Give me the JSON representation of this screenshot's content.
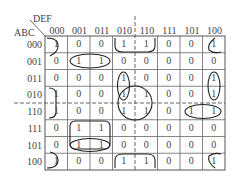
{
  "kmap": {
    "row_variables": "ABC",
    "col_variables": "DEF",
    "col_labels": [
      "000",
      "001",
      "011",
      "010",
      "110",
      "111",
      "101",
      "100"
    ],
    "row_labels": [
      "000",
      "001",
      "011",
      "010",
      "110",
      "111",
      "101",
      "100"
    ],
    "values": [
      [
        "1",
        "0",
        "0",
        "1",
        "1",
        "0",
        "0",
        "1"
      ],
      [
        "0",
        "1",
        "1",
        "0",
        "0",
        "0",
        "0",
        "0"
      ],
      [
        "0",
        "0",
        "0",
        "1",
        "0",
        "0",
        "0",
        "1"
      ],
      [
        "1",
        "0",
        "0",
        "1",
        "1",
        "0",
        "0",
        "1"
      ],
      [
        "1",
        "0",
        "0",
        "1",
        "1",
        "0",
        "1",
        "1"
      ],
      [
        "0",
        "1",
        "1",
        "0",
        "0",
        "0",
        "0",
        "0"
      ],
      [
        "0",
        "1",
        "1",
        "0",
        "0",
        "0",
        "0",
        "0"
      ],
      [
        "1",
        "0",
        "0",
        "1",
        "1",
        "0",
        "0",
        "1"
      ]
    ],
    "groupings": [
      "corners-row000-row100-col000-col100",
      "row000-row100-col010-col110",
      "row001-col001-col011",
      "row111-row101-col001-col011",
      "row101-col001-col011",
      "row010-row110-col010-col110",
      "row011-row010-col010",
      "row011-row010-col100",
      "row110-col101-col100",
      "row010-row110-col000"
    ]
  }
}
